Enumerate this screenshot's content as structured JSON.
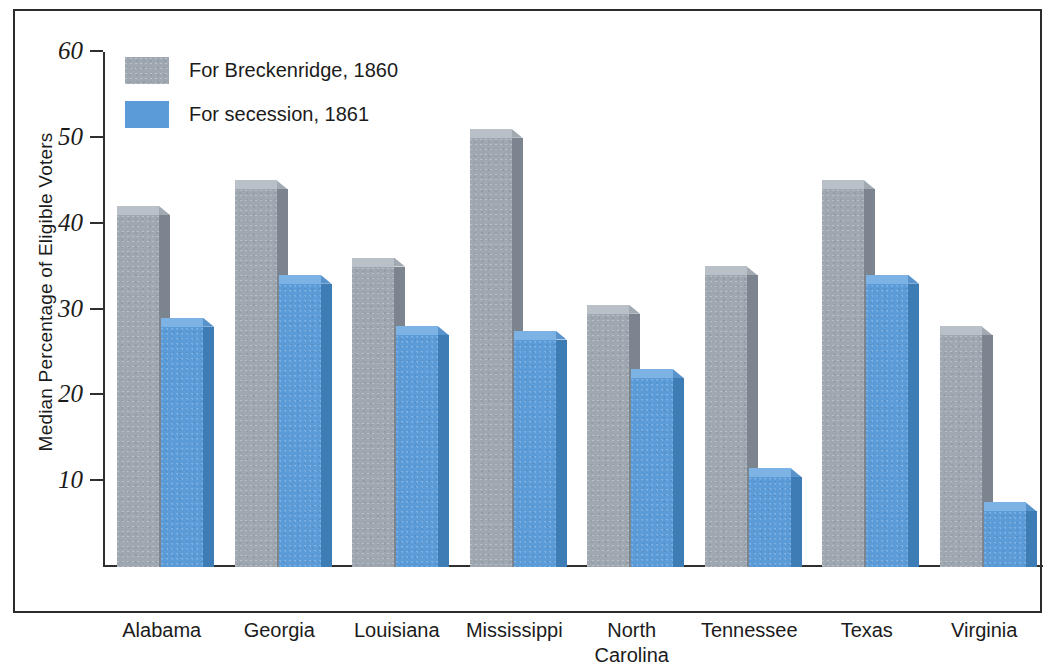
{
  "chart_data": {
    "type": "bar",
    "title": "",
    "xlabel": "",
    "ylabel": "Median Percentage of Eligible Voters",
    "ylim": [
      0,
      60
    ],
    "yticks": [
      10,
      20,
      30,
      40,
      50,
      60
    ],
    "grid": false,
    "legend_position": "top-left",
    "categories": [
      "Alabama",
      "Georgia",
      "Louisiana",
      "Mississippi",
      "North Carolina",
      "Tennessee",
      "Texas",
      "Virginia"
    ],
    "category_lines": [
      [
        "Alabama"
      ],
      [
        "Georgia"
      ],
      [
        "Louisiana"
      ],
      [
        "Mississippi"
      ],
      [
        "North",
        "Carolina"
      ],
      [
        "Tennessee"
      ],
      [
        "Texas"
      ],
      [
        "Virginia"
      ]
    ],
    "series": [
      {
        "name": "For Breckenridge, 1860",
        "color": "#9fa8b1",
        "values": [
          41,
          44,
          35,
          50,
          29.5,
          34,
          44,
          27
        ]
      },
      {
        "name": "For secession, 1861",
        "color": "#5a9bd8",
        "values": [
          28,
          33,
          27,
          26.5,
          22,
          10.5,
          33,
          6.5
        ]
      }
    ]
  },
  "legend": {
    "items": [
      {
        "label": "For Breckenridge, 1860",
        "swatch": "gray"
      },
      {
        "label": "For secession, 1861",
        "swatch": "blue"
      }
    ]
  },
  "colors": {
    "series_gray": "#9fa8b1",
    "series_blue": "#5a9bd8",
    "axis": "#2f2f2f",
    "frame": "#2b2b2b",
    "text": "#1b1b1b",
    "background": "#ffffff"
  }
}
